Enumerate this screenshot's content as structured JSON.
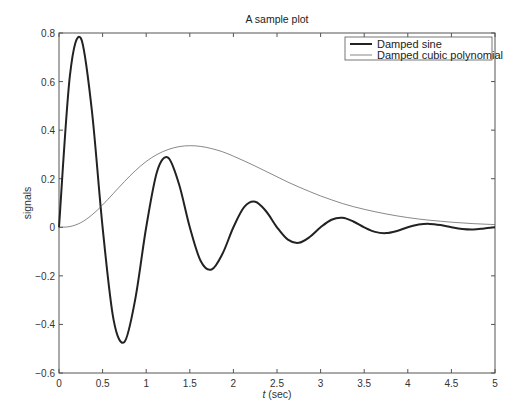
{
  "chart_data": {
    "type": "line",
    "title": "A sample plot",
    "xlabel_italic": "t",
    "xlabel_rest": " (sec)",
    "xlabel": "t (sec)",
    "ylabel": "signals",
    "xlim": [
      0,
      5
    ],
    "ylim": [
      -0.6,
      0.8
    ],
    "xticks": [
      0,
      0.5,
      1,
      1.5,
      2,
      2.5,
      3,
      3.5,
      4,
      4.5,
      5
    ],
    "xtick_labels": [
      "0",
      "0.5",
      "1",
      "1.5",
      "2",
      "2.5",
      "3",
      "3.5",
      "4",
      "4.5",
      "5"
    ],
    "yticks": [
      -0.6,
      -0.4,
      -0.2,
      0,
      0.2,
      0.4,
      0.6,
      0.8
    ],
    "ytick_labels": [
      "−0.6",
      "−0.4",
      "−0.2",
      "0",
      "0.2",
      "0.4",
      "0.6",
      "0.8"
    ],
    "grid": false,
    "legend_position": "upper right",
    "series": [
      {
        "name": "Damped sine",
        "color": "#222222",
        "line_width": 2,
        "x": [
          0,
          0.125,
          0.25,
          0.375,
          0.5,
          0.625,
          0.75,
          0.875,
          1,
          1.125,
          1.25,
          1.375,
          1.5,
          1.625,
          1.75,
          1.875,
          2,
          2.125,
          2.25,
          2.375,
          2.5,
          2.625,
          2.75,
          2.875,
          3,
          3.125,
          3.25,
          3.375,
          3.5,
          3.625,
          3.75,
          3.875,
          4,
          4.125,
          4.25,
          4.375,
          4.5,
          4.625,
          4.75,
          4.875,
          5
        ],
        "values": [
          0,
          0.624,
          0.779,
          0.487,
          0,
          -0.379,
          -0.472,
          -0.295,
          0,
          0.23,
          0.287,
          0.179,
          0,
          -0.139,
          -0.174,
          -0.109,
          0,
          0.084,
          0.105,
          0.066,
          0,
          -0.051,
          -0.064,
          -0.04,
          0,
          0.031,
          0.039,
          0.024,
          0,
          -0.019,
          -0.024,
          -0.015,
          0,
          0.011,
          0.014,
          0.009,
          0,
          -0.007,
          -0.009,
          -0.005,
          0
        ]
      },
      {
        "name": "Damped cubic polynomial",
        "color": "#555555",
        "line_width": 0.7,
        "x": [
          0,
          0.125,
          0.25,
          0.375,
          0.5,
          0.625,
          0.75,
          0.875,
          1,
          1.125,
          1.25,
          1.375,
          1.5,
          1.625,
          1.75,
          1.875,
          2,
          2.125,
          2.25,
          2.375,
          2.5,
          2.625,
          2.75,
          2.875,
          3,
          3.125,
          3.25,
          3.375,
          3.5,
          3.625,
          3.75,
          3.875,
          4,
          4.125,
          4.25,
          4.375,
          4.5,
          4.625,
          4.75,
          4.875,
          5
        ],
        "values": [
          0,
          0.003,
          0.019,
          0.05,
          0.092,
          0.14,
          0.188,
          0.233,
          0.271,
          0.3,
          0.32,
          0.332,
          0.336,
          0.333,
          0.324,
          0.311,
          0.293,
          0.273,
          0.252,
          0.23,
          0.208,
          0.186,
          0.166,
          0.147,
          0.129,
          0.113,
          0.098,
          0.085,
          0.074,
          0.064,
          0.055,
          0.047,
          0.04,
          0.034,
          0.029,
          0.025,
          0.021,
          0.018,
          0.015,
          0.013,
          0.011
        ]
      }
    ]
  }
}
